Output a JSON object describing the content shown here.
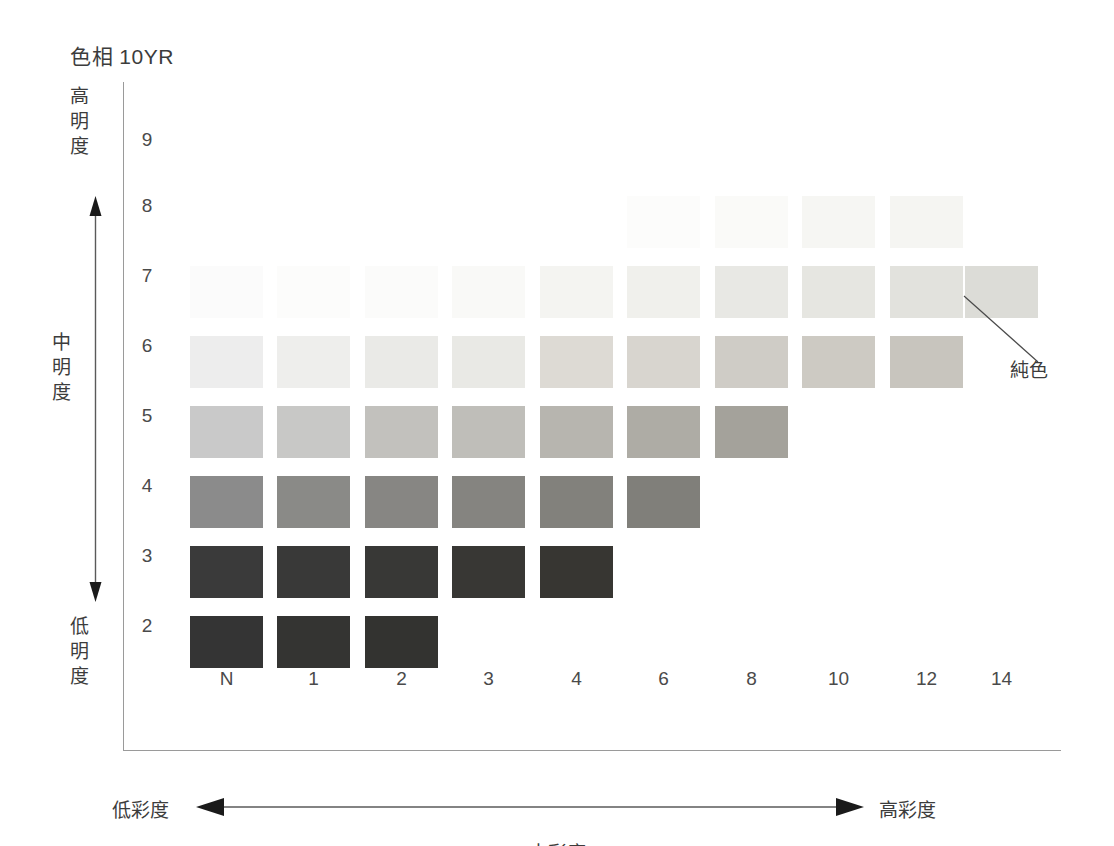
{
  "title": "色相 10YR",
  "axes": {
    "vertical": {
      "high_label": [
        "高",
        "明",
        "度"
      ],
      "mid_label": [
        "中",
        "明",
        "度"
      ],
      "low_label": [
        "低",
        "明",
        "度"
      ],
      "ticks": [
        "9",
        "8",
        "7",
        "6",
        "5",
        "4",
        "3",
        "2"
      ],
      "arrow_icon": "double-headed-vertical-arrow"
    },
    "horizontal": {
      "low_label": "低彩度",
      "mid_label": "中彩度",
      "high_label": "高彩度",
      "ticks": [
        "N",
        "1",
        "2",
        "3",
        "4",
        "6",
        "8",
        "10",
        "12",
        "14"
      ],
      "arrow_icon": "double-headed-horizontal-arrow"
    }
  },
  "annotation": {
    "label": "純色",
    "leader_icon": "leader-line",
    "target_row": "7",
    "target_col": "14"
  },
  "chart_data": {
    "type": "heatmap",
    "title": "色相 10YR",
    "xlabel": "中彩度",
    "ylabel": "中明度",
    "grid": false,
    "legend": "none",
    "x_categories": [
      "N",
      "1",
      "2",
      "3",
      "4",
      "6",
      "8",
      "10",
      "12",
      "14"
    ],
    "y_categories": [
      "9",
      "8",
      "7",
      "6",
      "5",
      "4",
      "3",
      "2"
    ],
    "note": "Munsell-style tone chart for hue 10YR; cells show printed swatch colors, empty cells have no swatch.",
    "cells": [
      {
        "row": "9",
        "col": "N",
        "color": null
      },
      {
        "row": "9",
        "col": "1",
        "color": null
      },
      {
        "row": "9",
        "col": "2",
        "color": null
      },
      {
        "row": "9",
        "col": "3",
        "color": null
      },
      {
        "row": "9",
        "col": "4",
        "color": null
      },
      {
        "row": "9",
        "col": "6",
        "color": null
      },
      {
        "row": "9",
        "col": "8",
        "color": null
      },
      {
        "row": "9",
        "col": "10",
        "color": null
      },
      {
        "row": "9",
        "col": "12",
        "color": null
      },
      {
        "row": "9",
        "col": "14",
        "color": null
      },
      {
        "row": "8",
        "col": "N",
        "color": null
      },
      {
        "row": "8",
        "col": "1",
        "color": null
      },
      {
        "row": "8",
        "col": "2",
        "color": null
      },
      {
        "row": "8",
        "col": "3",
        "color": null
      },
      {
        "row": "8",
        "col": "4",
        "color": null
      },
      {
        "row": "8",
        "col": "6",
        "color": "#fcfcfb"
      },
      {
        "row": "8",
        "col": "8",
        "color": "#fafaf8"
      },
      {
        "row": "8",
        "col": "10",
        "color": "#f6f6f3"
      },
      {
        "row": "8",
        "col": "12",
        "color": "#f5f5f2"
      },
      {
        "row": "8",
        "col": "14",
        "color": null
      },
      {
        "row": "7",
        "col": "N",
        "color": "#fbfbfb"
      },
      {
        "row": "7",
        "col": "1",
        "color": "#fcfcfb"
      },
      {
        "row": "7",
        "col": "2",
        "color": "#fbfbfa"
      },
      {
        "row": "7",
        "col": "3",
        "color": "#f9f9f7"
      },
      {
        "row": "7",
        "col": "4",
        "color": "#f4f4f1"
      },
      {
        "row": "7",
        "col": "6",
        "color": "#f0f0ec"
      },
      {
        "row": "7",
        "col": "8",
        "color": "#e8e8e4"
      },
      {
        "row": "7",
        "col": "10",
        "color": "#e6e6e1"
      },
      {
        "row": "7",
        "col": "12",
        "color": "#e2e2dd"
      },
      {
        "row": "7",
        "col": "14",
        "color": "#dcdcd7"
      },
      {
        "row": "6",
        "col": "N",
        "color": "#ededed"
      },
      {
        "row": "6",
        "col": "1",
        "color": "#eeeeec"
      },
      {
        "row": "6",
        "col": "2",
        "color": "#eaeae7"
      },
      {
        "row": "6",
        "col": "3",
        "color": "#e9e9e5"
      },
      {
        "row": "6",
        "col": "4",
        "color": "#dddad4"
      },
      {
        "row": "6",
        "col": "6",
        "color": "#d8d5cf"
      },
      {
        "row": "6",
        "col": "8",
        "color": "#cfccc6"
      },
      {
        "row": "6",
        "col": "10",
        "color": "#cdcac3"
      },
      {
        "row": "6",
        "col": "12",
        "color": "#c8c5be"
      },
      {
        "row": "6",
        "col": "14",
        "color": null
      },
      {
        "row": "5",
        "col": "N",
        "color": "#c9c9c9"
      },
      {
        "row": "5",
        "col": "1",
        "color": "#c8c8c6"
      },
      {
        "row": "5",
        "col": "2",
        "color": "#c2c1bd"
      },
      {
        "row": "5",
        "col": "3",
        "color": "#bfbeb9"
      },
      {
        "row": "5",
        "col": "4",
        "color": "#b7b5af"
      },
      {
        "row": "5",
        "col": "6",
        "color": "#aeaca5"
      },
      {
        "row": "5",
        "col": "8",
        "color": "#a4a29b"
      },
      {
        "row": "5",
        "col": "10",
        "color": null
      },
      {
        "row": "5",
        "col": "12",
        "color": null
      },
      {
        "row": "5",
        "col": "14",
        "color": null
      },
      {
        "row": "4",
        "col": "N",
        "color": "#8b8b8b"
      },
      {
        "row": "4",
        "col": "1",
        "color": "#8a8a87"
      },
      {
        "row": "4",
        "col": "2",
        "color": "#878683"
      },
      {
        "row": "4",
        "col": "3",
        "color": "#858480"
      },
      {
        "row": "4",
        "col": "4",
        "color": "#82817c"
      },
      {
        "row": "4",
        "col": "6",
        "color": "#807f7a"
      },
      {
        "row": "4",
        "col": "8",
        "color": null
      },
      {
        "row": "4",
        "col": "10",
        "color": null
      },
      {
        "row": "4",
        "col": "12",
        "color": null
      },
      {
        "row": "4",
        "col": "14",
        "color": null
      },
      {
        "row": "3",
        "col": "N",
        "color": "#3a3a3a"
      },
      {
        "row": "3",
        "col": "1",
        "color": "#393938"
      },
      {
        "row": "3",
        "col": "2",
        "color": "#383836"
      },
      {
        "row": "3",
        "col": "3",
        "color": "#383734"
      },
      {
        "row": "3",
        "col": "4",
        "color": "#373632"
      },
      {
        "row": "3",
        "col": "6",
        "color": null
      },
      {
        "row": "3",
        "col": "8",
        "color": null
      },
      {
        "row": "3",
        "col": "10",
        "color": null
      },
      {
        "row": "3",
        "col": "12",
        "color": null
      },
      {
        "row": "3",
        "col": "14",
        "color": null
      },
      {
        "row": "2",
        "col": "N",
        "color": "#343434"
      },
      {
        "row": "2",
        "col": "1",
        "color": "#343432"
      },
      {
        "row": "2",
        "col": "2",
        "color": "#333330"
      },
      {
        "row": "2",
        "col": "3",
        "color": null
      },
      {
        "row": "2",
        "col": "4",
        "color": null
      },
      {
        "row": "2",
        "col": "6",
        "color": null
      },
      {
        "row": "2",
        "col": "8",
        "color": null
      },
      {
        "row": "2",
        "col": "10",
        "color": null
      },
      {
        "row": "2",
        "col": "12",
        "color": null
      },
      {
        "row": "2",
        "col": "14",
        "color": null
      }
    ]
  },
  "layout": {
    "col_x": [
      190,
      277,
      365,
      452,
      540,
      627,
      715,
      802,
      890,
      965
    ],
    "row_y": [
      130,
      196,
      266,
      336,
      406,
      476,
      546,
      616
    ],
    "tick_y": [
      142,
      208,
      278,
      348,
      418,
      488,
      558,
      628
    ],
    "swatch_w": 73,
    "swatch_h": 52
  }
}
